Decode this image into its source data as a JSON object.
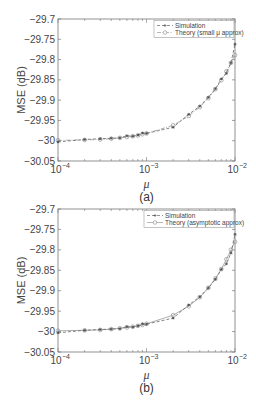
{
  "chart_data": [
    {
      "type": "line",
      "panel_label": "(a)",
      "title": "",
      "xlabel": "μ",
      "ylabel": "MSE (dB)",
      "xscale": "log",
      "xlim": [
        0.0001,
        0.01
      ],
      "ylim": [
        -30.05,
        -29.7
      ],
      "yticks": [
        "-29.7",
        "-29.75",
        "-29.8",
        "-29.85",
        "-29.9",
        "-29.95",
        "-30",
        "-30.05"
      ],
      "xticks": [
        "10^-4",
        "10^-3",
        "10^-2"
      ],
      "grid": false,
      "legend_position": "upper right",
      "x": [
        0.0001,
        0.0002,
        0.0003,
        0.0004,
        0.0005,
        0.0006,
        0.0007,
        0.0008,
        0.0009,
        0.001,
        0.002,
        0.003,
        0.004,
        0.005,
        0.006,
        0.007,
        0.008,
        0.009,
        0.01
      ],
      "series": [
        {
          "name": "Simulation",
          "style": "dashed",
          "marker": "*",
          "values": [
            -30.003,
            -29.997,
            -29.995,
            -29.994,
            -29.993,
            -29.988,
            -29.989,
            -29.986,
            -29.981,
            -29.982,
            -29.967,
            -29.935,
            -29.915,
            -29.893,
            -29.872,
            -29.848,
            -29.834,
            -29.808,
            -29.762
          ]
        },
        {
          "name": "Theory (small μ approx)",
          "style": "dash-dot",
          "marker": "o",
          "values": [
            -29.999,
            -29.998,
            -29.997,
            -29.995,
            -29.993,
            -29.991,
            -29.989,
            -29.987,
            -29.984,
            -29.982,
            -29.962,
            -29.939,
            -29.917,
            -29.895,
            -29.873,
            -29.851,
            -29.829,
            -29.808,
            -29.789
          ]
        }
      ]
    },
    {
      "type": "line",
      "panel_label": "(b)",
      "title": "",
      "xlabel": "μ",
      "ylabel": "MSE (dB)",
      "xscale": "log",
      "xlim": [
        0.0001,
        0.01
      ],
      "ylim": [
        -30.05,
        -29.7
      ],
      "yticks": [
        "-29.7",
        "-29.75",
        "-29.8",
        "-29.85",
        "-29.9",
        "-29.95",
        "-30",
        "-30.05"
      ],
      "xticks": [
        "10^-4",
        "10^-3",
        "10^-2"
      ],
      "grid": false,
      "legend_position": "upper right",
      "x": [
        0.0001,
        0.0002,
        0.0003,
        0.0004,
        0.0005,
        0.0006,
        0.0007,
        0.0008,
        0.0009,
        0.001,
        0.002,
        0.003,
        0.004,
        0.005,
        0.006,
        0.007,
        0.008,
        0.009,
        0.01
      ],
      "series": [
        {
          "name": "Simulation",
          "style": "dashed",
          "marker": "*",
          "values": [
            -30.003,
            -29.997,
            -29.995,
            -29.994,
            -29.993,
            -29.988,
            -29.989,
            -29.986,
            -29.981,
            -29.982,
            -29.967,
            -29.935,
            -29.915,
            -29.893,
            -29.872,
            -29.848,
            -29.834,
            -29.808,
            -29.762
          ]
        },
        {
          "name": "Theory (asymptotic approx)",
          "style": "solid",
          "marker": "o",
          "values": [
            -29.998,
            -29.997,
            -29.996,
            -29.994,
            -29.992,
            -29.99,
            -29.988,
            -29.986,
            -29.984,
            -29.981,
            -29.96,
            -29.938,
            -29.916,
            -29.893,
            -29.87,
            -29.847,
            -29.823,
            -29.8,
            -29.78
          ]
        }
      ]
    }
  ],
  "labels": {
    "panel_a": "(a)",
    "panel_b": "(b)",
    "ylabel": "MSE (dB)",
    "xlabel": "μ",
    "legend_a_sim": "Simulation",
    "legend_a_theory": "Theory (small μ approx)",
    "legend_b_sim": "Simulation",
    "legend_b_theory": "Theory (asymptotic approx)",
    "x_ticks": [
      "10",
      "10",
      "10"
    ],
    "x_exps": [
      "−4",
      "−3",
      "−2"
    ],
    "y_ticks": [
      "−29.7",
      "−29.75",
      "−29.8",
      "−29.85",
      "−29.9",
      "−29.95",
      "−30",
      "−30.05"
    ]
  }
}
